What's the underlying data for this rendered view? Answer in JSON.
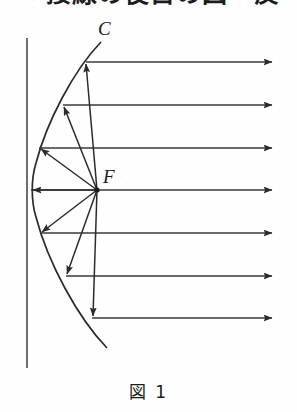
{
  "page": {
    "background_color": "#fefefe",
    "width": 297,
    "height": 412
  },
  "heading": {
    "text": "接線の役目の図　反",
    "note_visible_portion": "bottom-edge-only"
  },
  "figure": {
    "caption": "図 1",
    "title_label": "図",
    "number_label": "1",
    "stroke_color": "#2b2b2b",
    "labels": {
      "curve": "C",
      "focus": "F"
    },
    "axis_line": {
      "name": "directrix-vertical-line",
      "x": 27,
      "y_top": 25,
      "y_bottom": 355
    },
    "focus_point": {
      "x": 97,
      "y": 177
    },
    "vertex_point": {
      "x": 31,
      "y": 177
    },
    "parabola": {
      "vertex_x": 31,
      "vertex_y": 177,
      "top_end": {
        "x": 101,
        "y": 29
      },
      "bottom_end": {
        "x": 107,
        "y": 335
      }
    },
    "incoming_rays": {
      "count": 7,
      "direction": "rightward",
      "arrow_tip_x": 272,
      "y_values": [
        49,
        92,
        135,
        177,
        220,
        263,
        305
      ]
    },
    "reflected_rays": {
      "count": 7,
      "direction": "toward-mirror-surface",
      "origin": "focus"
    },
    "hit_points": [
      {
        "x": 86,
        "y": 49
      },
      {
        "x": 63,
        "y": 92
      },
      {
        "x": 39,
        "y": 135
      },
      {
        "x": 31,
        "y": 177
      },
      {
        "x": 40,
        "y": 220
      },
      {
        "x": 66,
        "y": 263
      },
      {
        "x": 92,
        "y": 305
      }
    ]
  }
}
